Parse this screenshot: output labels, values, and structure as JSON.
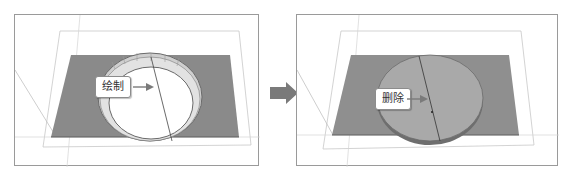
{
  "figure": {
    "left_panel": {
      "callout_label": "绘制",
      "shape": "ring",
      "plane_color": "#8a8a8a",
      "ring_color": "#d8d8d8"
    },
    "transition_arrow": {
      "icon": "right-arrow-icon",
      "color": "#7a7a7a"
    },
    "right_panel": {
      "callout_label": "删除",
      "shape": "disk",
      "plane_color": "#8a8a8a",
      "disk_color": "#a8a8a8"
    }
  }
}
